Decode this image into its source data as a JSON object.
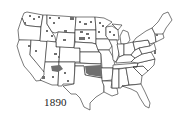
{
  "map": {
    "title": "1890",
    "subject": "United States with reservation lands shaded",
    "colors": {
      "background": "#ffffff",
      "state_fill": "#ffffff",
      "state_border": "#222222",
      "reservation_fill": "#6f6f6f"
    },
    "label": "1890",
    "features": {
      "largest_shaded_region": "Indian Territory (Oklahoma)",
      "other_shaded_regions": [
        "Arizona",
        "New Mexico",
        "Dakotas",
        "Montana",
        "Washington",
        "Idaho",
        "Wyoming",
        "Nevada",
        "Utah",
        "Wisconsin",
        "Minnesota"
      ]
    }
  }
}
